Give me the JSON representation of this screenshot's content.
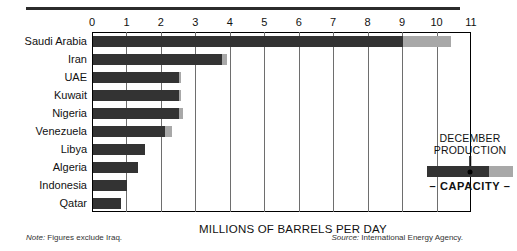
{
  "chart_data": {
    "type": "bar",
    "orientation": "horizontal",
    "title": "",
    "xlabel": "MILLIONS OF BARRELS PER DAY",
    "ylabel": "",
    "xlim": [
      0,
      11
    ],
    "xticks": [
      0,
      1,
      2,
      3,
      4,
      5,
      6,
      7,
      8,
      9,
      10,
      11
    ],
    "grid": true,
    "grid_axis": "x",
    "categories": [
      "Saudi Arabia",
      "Iran",
      "UAE",
      "Kuwait",
      "Nigeria",
      "Venezuela",
      "Libya",
      "Algeria",
      "Indonesia",
      "Qatar"
    ],
    "series": [
      {
        "name": "DECEMBER PRODUCTION",
        "color": "#333333",
        "values": [
          9.0,
          3.75,
          2.5,
          2.5,
          2.5,
          2.1,
          1.5,
          1.3,
          1.0,
          0.8
        ]
      },
      {
        "name": "CAPACITY",
        "color": "#a8a8a8",
        "values": [
          10.4,
          3.9,
          2.55,
          2.55,
          2.6,
          2.3,
          1.5,
          1.3,
          1.0,
          0.8
        ]
      }
    ]
  },
  "legend": {
    "title_line1": "DECEMBER",
    "title_line2": "PRODUCTION",
    "capacity_label": "– CAPACITY –"
  },
  "footnotes": {
    "note_prefix": "Note:",
    "note_text": " Figures exclude Iraq.",
    "source_prefix": "Source:",
    "source_text": " International Energy Agency."
  },
  "colors": {
    "production": "#333333",
    "capacity": "#a8a8a8",
    "frame": "#000000",
    "grid": "#6e6e6e",
    "rule": "#2b2b2b"
  }
}
